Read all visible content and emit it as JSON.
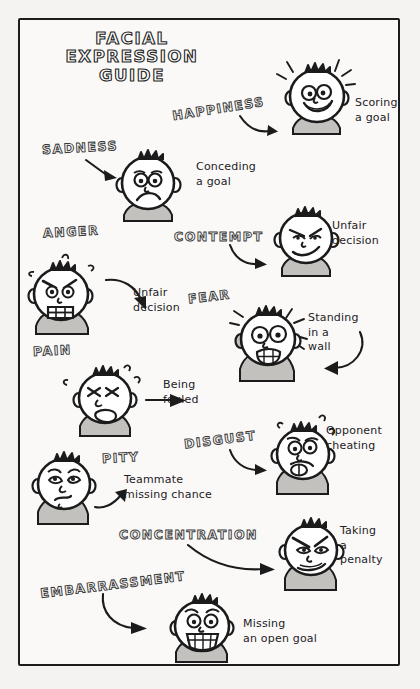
{
  "poster": {
    "title_lines": [
      "FACIAL",
      "EXPRESSION",
      "GUIDE"
    ],
    "background_color": "#f4f3f1",
    "paper_color": "#faf9f7",
    "ink_color": "#1c1c1c",
    "shade_color": "#b9b7b4"
  },
  "entries": [
    {
      "id": "happiness",
      "label": "HAPPINESS",
      "caption": "Scoring\na  goal",
      "expression": "happy",
      "face_marks": "starburst-lines"
    },
    {
      "id": "sadness",
      "label": "SADNESS",
      "caption": "Conceding\n a goal",
      "expression": "sad",
      "face_marks": "none"
    },
    {
      "id": "anger",
      "label": "ANGER",
      "caption": "Unfair\ndecision",
      "expression": "angry",
      "face_marks": "steam-puffs"
    },
    {
      "id": "contempt",
      "label": "CONTEMPT",
      "caption": "Unfair\ndecision",
      "expression": "contempt",
      "face_marks": "none"
    },
    {
      "id": "fear",
      "label": "FEAR",
      "caption": "Standing\n   in a\n wall",
      "expression": "fear",
      "face_marks": "shock-lines"
    },
    {
      "id": "pain",
      "label": "PAIN",
      "caption": "Being\nfouled",
      "expression": "pain",
      "face_marks": "sweat-drops"
    },
    {
      "id": "disgust",
      "label": "DISGUST",
      "caption": "Opponent\ncheating",
      "expression": "disgust",
      "face_marks": "sweat-drops"
    },
    {
      "id": "pity",
      "label": "PITY",
      "caption": "Teammate\n missing chance",
      "expression": "pity",
      "face_marks": "none"
    },
    {
      "id": "concentration",
      "label": "CONCENTRATION",
      "caption": "Taking\n   a\npenalty",
      "expression": "concentration",
      "face_marks": "none"
    },
    {
      "id": "embarrassment",
      "label": "EMBARRASSMENT",
      "caption": "Missing\n an open goal",
      "expression": "embarrassment",
      "face_marks": "none"
    }
  ]
}
